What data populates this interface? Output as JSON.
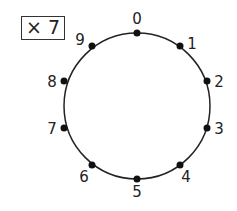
{
  "multiplier_label": "× 7",
  "circle": {
    "cx": 137,
    "cy": 106,
    "r": 73,
    "stroke": "#222222"
  },
  "points": [
    {
      "label": "0",
      "x": 137,
      "y": 33,
      "lx": 137,
      "ly": 24
    },
    {
      "label": "1",
      "x": 180,
      "y": 46,
      "lx": 192,
      "ly": 49
    },
    {
      "label": "2",
      "x": 207,
      "y": 81,
      "lx": 219,
      "ly": 87
    },
    {
      "label": "3",
      "x": 207,
      "y": 128,
      "lx": 219,
      "ly": 134
    },
    {
      "label": "4",
      "x": 180,
      "y": 165,
      "lx": 186,
      "ly": 182
    },
    {
      "label": "5",
      "x": 137,
      "y": 179,
      "lx": 137,
      "ly": 197
    },
    {
      "label": "6",
      "x": 92,
      "y": 165,
      "lx": 84,
      "ly": 182
    },
    {
      "label": "7",
      "x": 64,
      "y": 128,
      "lx": 52,
      "ly": 134
    },
    {
      "label": "8",
      "x": 64,
      "y": 81,
      "lx": 52,
      "ly": 87
    },
    {
      "label": "9",
      "x": 92,
      "y": 46,
      "lx": 80,
      "ly": 45
    }
  ]
}
